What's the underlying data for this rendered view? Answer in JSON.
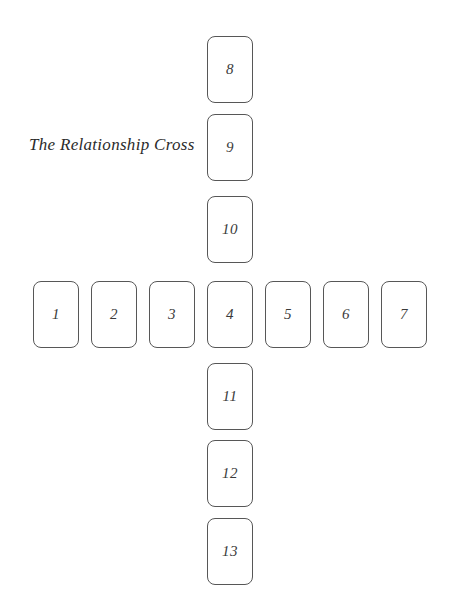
{
  "page": {
    "title": "The Relationship Cross",
    "width": 452,
    "height": 613,
    "background_color": "#ffffff"
  },
  "style": {
    "card_border_color": "#575757",
    "card_fill_color": "#ffffff",
    "number_color": "#3a3a3a",
    "title_color": "#2b2b2b",
    "card_width": 46,
    "card_height": 67,
    "card_corner_radius": 8
  },
  "spread": {
    "name": "The Relationship Cross",
    "shape": "cross",
    "total_positions": 13,
    "horizontal_row_labels": [
      "1",
      "2",
      "3",
      "4",
      "5",
      "6",
      "7"
    ],
    "vertical_upper_labels": [
      "8",
      "9",
      "10"
    ],
    "vertical_center_label": "4",
    "vertical_lower_labels": [
      "11",
      "12",
      "13"
    ],
    "cards": [
      {
        "label": "1",
        "x": 33,
        "y": 281,
        "arm": "horizontal"
      },
      {
        "label": "2",
        "x": 91,
        "y": 281,
        "arm": "horizontal"
      },
      {
        "label": "3",
        "x": 149,
        "y": 281,
        "arm": "horizontal"
      },
      {
        "label": "4",
        "x": 207,
        "y": 281,
        "arm": "center"
      },
      {
        "label": "5",
        "x": 265,
        "y": 281,
        "arm": "horizontal"
      },
      {
        "label": "6",
        "x": 323,
        "y": 281,
        "arm": "horizontal"
      },
      {
        "label": "7",
        "x": 381,
        "y": 281,
        "arm": "horizontal"
      },
      {
        "label": "8",
        "x": 207,
        "y": 36,
        "arm": "vertical-upper"
      },
      {
        "label": "9",
        "x": 207,
        "y": 114,
        "arm": "vertical-upper"
      },
      {
        "label": "10",
        "x": 207,
        "y": 196,
        "arm": "vertical-upper"
      },
      {
        "label": "11",
        "x": 207,
        "y": 363,
        "arm": "vertical-lower"
      },
      {
        "label": "12",
        "x": 207,
        "y": 440,
        "arm": "vertical-lower"
      },
      {
        "label": "13",
        "x": 207,
        "y": 518,
        "arm": "vertical-lower"
      }
    ]
  }
}
